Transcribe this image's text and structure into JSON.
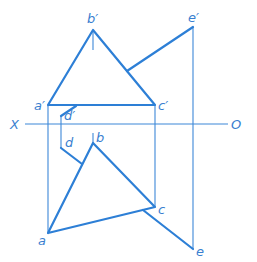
{
  "diagram": {
    "type": "orthographic-projection",
    "colors": {
      "line": "#2d7fd6",
      "label": "#3a7fd0",
      "background": "#ffffff"
    },
    "axis": {
      "left_label": "X",
      "right_label": "O"
    },
    "labels": {
      "a_prime": "a′",
      "b_prime": "b′",
      "c_prime": "c′",
      "d_prime": "d′",
      "e_prime": "e′",
      "a": "a",
      "b": "b",
      "c": "c",
      "d": "d",
      "e": "e"
    }
  }
}
